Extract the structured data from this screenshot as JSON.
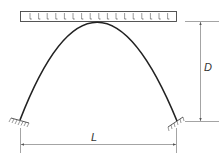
{
  "diagram": {
    "type": "parabolic-arch-with-uniform-load",
    "labels": {
      "depth": "D",
      "span": "L"
    },
    "load": {
      "kind": "uniformly-distributed",
      "arrow_count": 18
    },
    "supports": {
      "left": "fixed",
      "right": "fixed"
    },
    "colors": {
      "line": "#333333",
      "dimension": "#555555",
      "background": "#ffffff"
    }
  }
}
